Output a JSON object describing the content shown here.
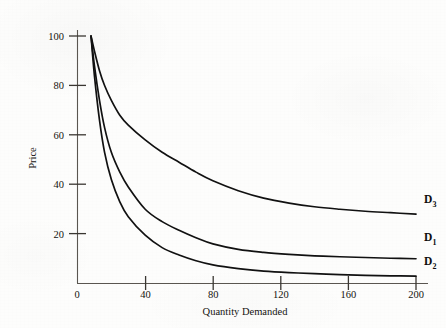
{
  "figure": {
    "background_color": "#fdfdfc",
    "ink_color": "#15130f"
  },
  "chart_data": {
    "type": "line",
    "title": "",
    "subtitle": "",
    "xlabel": "Quantity Demanded",
    "ylabel": "Price",
    "xlim": [
      0,
      200
    ],
    "ylim": [
      0,
      100
    ],
    "xticks": [
      0,
      40,
      80,
      120,
      160,
      200
    ],
    "xtick_labels": [
      "0",
      "40",
      "80",
      "120",
      "160",
      "200"
    ],
    "yticks": [
      0,
      20,
      40,
      60,
      80,
      100
    ],
    "ytick_labels": [
      "0",
      "20",
      "40",
      "60",
      "80",
      "100"
    ],
    "grid": false,
    "legend": "inline-right-end-labels",
    "annotations": [
      {
        "text": "D",
        "subscript": "3",
        "x": 200,
        "y": 28
      },
      {
        "text": "D",
        "subscript": "1",
        "x": 200,
        "y": 10
      },
      {
        "text": "D",
        "subscript": "2",
        "x": 200,
        "y": 3
      }
    ],
    "series": [
      {
        "name": "D3",
        "label": "D",
        "label_subscript": "3",
        "color": "#111111",
        "x": [
          8,
          10,
          13,
          16,
          20,
          25,
          30,
          40,
          50,
          60,
          70,
          80,
          95,
          110,
          125,
          140,
          155,
          170,
          185,
          200
        ],
        "values": [
          100,
          94,
          86,
          80,
          74,
          68,
          64,
          58,
          53,
          49,
          45,
          41.5,
          37.5,
          34.5,
          32.5,
          31,
          30,
          29.2,
          28.6,
          28
        ]
      },
      {
        "name": "D1",
        "label": "D",
        "label_subscript": "1",
        "color": "#111111",
        "x": [
          8,
          10,
          13,
          16,
          20,
          25,
          30,
          40,
          50,
          60,
          70,
          80,
          95,
          110,
          125,
          140,
          155,
          170,
          185,
          200
        ],
        "values": [
          100,
          88,
          74,
          63,
          53,
          45,
          39,
          30,
          25,
          21.5,
          18.5,
          16,
          13.8,
          12.6,
          11.8,
          11.2,
          10.8,
          10.5,
          10.2,
          10
        ]
      },
      {
        "name": "D2",
        "label": "D",
        "label_subscript": "2",
        "color": "#111111",
        "x": [
          8,
          10,
          13,
          16,
          20,
          25,
          30,
          40,
          50,
          60,
          70,
          80,
          95,
          110,
          125,
          140,
          155,
          170,
          185,
          200
        ],
        "values": [
          100,
          84,
          66,
          53,
          42,
          33,
          27,
          19.5,
          14.5,
          11.5,
          9.2,
          7.5,
          6.0,
          5.0,
          4.4,
          4.0,
          3.6,
          3.3,
          3.1,
          3
        ]
      }
    ]
  }
}
